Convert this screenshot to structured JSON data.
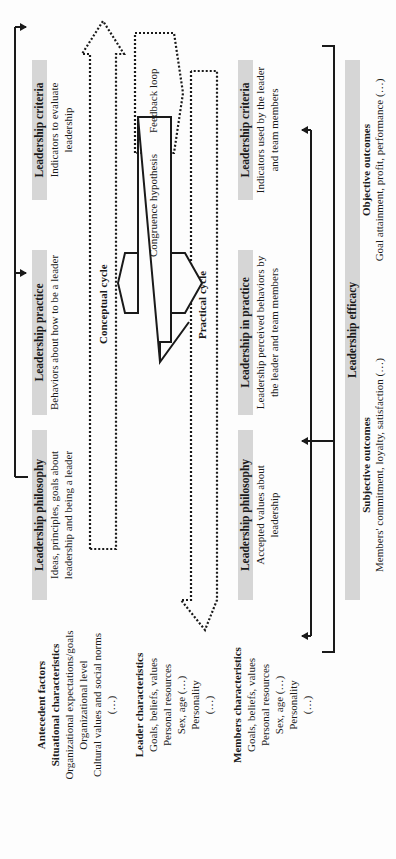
{
  "antecedent": {
    "title": "Antecedent factors",
    "situational": {
      "title": "Situational characteristics",
      "items": [
        "Organizational expectations/goals",
        "Organizational level",
        "Cultural values and social norms",
        "(…)"
      ]
    },
    "leader": {
      "title": "Leader characteristics",
      "items": [
        "Goals, beliefs, values",
        "Personal resources",
        "Sex, age (…)",
        "Personality",
        "(…)"
      ]
    },
    "members": {
      "title": "Members characteristics",
      "items": [
        "Goals, beliefs, values",
        "Personal resources",
        "Sex, age (…)",
        "Personality",
        "(…)"
      ]
    }
  },
  "conceptual_row": {
    "philosophy": {
      "title": "Leadership philosophy",
      "desc": "Ideas, principles, goals about leadership and being a leader"
    },
    "practice": {
      "title": "Leadership practice",
      "desc": "Behaviors about how to be a leader"
    },
    "criteria": {
      "title": "Leadership criteria",
      "desc": "Indicators to evaluate leadership"
    }
  },
  "cycles": {
    "conceptual": "Conceptual cycle",
    "practical": "Practical cycle",
    "congruence": "Congruence hypothesis",
    "feedback": "Feedback loop"
  },
  "practical_row": {
    "philosophy": {
      "title": "Leadership philosophy",
      "desc": "Accepted values about leadership"
    },
    "in_practice": {
      "title": "Leadership in practice",
      "desc": "Leadership perceived behaviors by the leader and team members"
    },
    "criteria": {
      "title": "Leadership criteria",
      "desc": "Indicators used by the leader and team members"
    }
  },
  "efficacy": {
    "title": "Leadership efficacy",
    "subjective": {
      "title": "Subjective outcomes",
      "desc": "Members' commitment, loyalty, satisfaction (…)"
    },
    "objective": {
      "title": "Objective outcomes",
      "desc": "Goal attainment, profit, performance (…)"
    }
  },
  "colors": {
    "header_bar": "#d6d6d6",
    "line": "#1a1a1a",
    "background": "#fdfdfd"
  }
}
